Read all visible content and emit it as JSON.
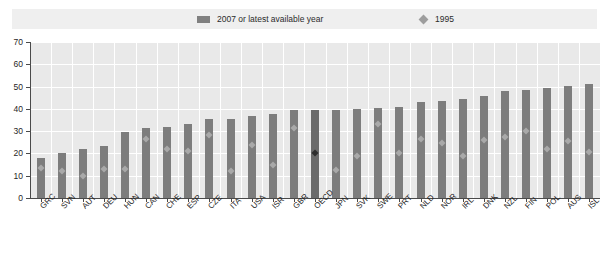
{
  "legend": {
    "bars_label": "2007 or latest available year",
    "diamond_label": "1995",
    "bar_swatch_icon": "bar-swatch-icon",
    "diamond_swatch_icon": "diamond-marker-icon"
  },
  "axis": {
    "y_ticks": [
      "0",
      "10",
      "20",
      "30",
      "40",
      "50",
      "60",
      "70"
    ]
  },
  "chart_data": {
    "type": "bar",
    "title": "",
    "subtitle": "",
    "xlabel": "",
    "ylabel": "",
    "ylim": [
      0,
      70
    ],
    "ytick_step": 10,
    "grid": true,
    "legend_position": "top",
    "highlight_category": "OECD",
    "categories": [
      "GRC",
      "SVN",
      "AUT",
      "DEU",
      "HUN",
      "CAN",
      "CHE",
      "ESP",
      "CZE",
      "ITA",
      "USA",
      "ISR",
      "GBR",
      "OECD",
      "JPN",
      "SVK",
      "SWE",
      "PRT",
      "NLD",
      "NOR",
      "IRL",
      "DNK",
      "NZL",
      "FIN",
      "POL",
      "AUS",
      "ISL"
    ],
    "series": [
      {
        "name": "2007 or latest available year",
        "type": "bar",
        "color": "#7d7d7d",
        "values": [
          18.0,
          20.3,
          22.2,
          23.5,
          29.8,
          31.3,
          32.0,
          33.0,
          35.5,
          35.6,
          37.0,
          37.6,
          39.5,
          39.5,
          39.6,
          39.8,
          40.2,
          40.8,
          43.2,
          43.6,
          44.3,
          45.7,
          48.2,
          48.5,
          49.4,
          50.2,
          51.0
        ]
      },
      {
        "name": "1995",
        "type": "scatter",
        "marker": "diamond",
        "color": "#a9a9a9",
        "values": [
          13.5,
          12.0,
          10.0,
          13.0,
          13.0,
          26.5,
          22.0,
          21.0,
          28.5,
          12.0,
          24.0,
          15.0,
          31.5,
          20.0,
          12.5,
          19.0,
          33.0,
          20.0,
          26.5,
          24.5,
          19.0,
          26.0,
          27.5,
          30.0,
          22.0,
          25.5,
          20.5
        ]
      }
    ],
    "note": "Bars sorted ascending; final category ISL reaches 65."
  }
}
